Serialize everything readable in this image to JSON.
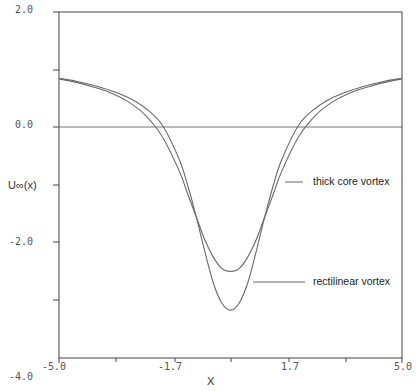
{
  "chart_data": {
    "type": "line",
    "title": "",
    "xlabel": "X",
    "ylabel": "U∞(x)",
    "xlim": [
      -5.0,
      5.0
    ],
    "ylim": [
      -4.0,
      2.0
    ],
    "x_tick_labels": [
      "-5.0",
      "-1.7",
      "1.7",
      "5.0"
    ],
    "x_ticks": [
      -5.0,
      -3.33,
      -1.67,
      0.0,
      1.67,
      3.33,
      5.0
    ],
    "y_tick_labels": [
      "2.0",
      "0.0",
      "-2.0",
      "-4.0"
    ],
    "y_ticks": [
      2.0,
      1.0,
      0.0,
      -1.0,
      -2.0,
      -3.0,
      -4.0
    ],
    "grid": false,
    "legend": "none (inline annotations)",
    "reference_line": {
      "y": 0.0
    },
    "x": [
      -5.0,
      -4.5,
      -4.0,
      -3.5,
      -3.0,
      -2.5,
      -2.0,
      -1.5,
      -1.25,
      -1.0,
      -0.75,
      -0.5,
      -0.25,
      0.0,
      0.25,
      0.5,
      0.75,
      1.0,
      1.25,
      1.5,
      2.0,
      2.5,
      3.0,
      3.5,
      4.0,
      4.5,
      5.0
    ],
    "series": [
      {
        "name": "thick core vortex",
        "values": [
          0.84,
          0.78,
          0.7,
          0.6,
          0.45,
          0.22,
          -0.15,
          -0.75,
          -1.15,
          -1.55,
          -1.95,
          -2.25,
          -2.45,
          -2.5,
          -2.45,
          -2.25,
          -1.95,
          -1.55,
          -1.15,
          -0.75,
          -0.15,
          0.22,
          0.45,
          0.6,
          0.7,
          0.78,
          0.84
        ]
      },
      {
        "name": "rectilinear vortex",
        "values": [
          0.85,
          0.8,
          0.73,
          0.64,
          0.52,
          0.34,
          0.05,
          -0.55,
          -1.0,
          -1.55,
          -2.15,
          -2.7,
          -3.05,
          -3.17,
          -3.05,
          -2.7,
          -2.15,
          -1.55,
          -1.0,
          -0.55,
          0.05,
          0.34,
          0.52,
          0.64,
          0.73,
          0.8,
          0.85
        ]
      }
    ],
    "annotations": [
      {
        "text": "thick core vortex",
        "points_to": "thick core vortex",
        "at_x": 1.1,
        "at_y": -1.45
      },
      {
        "text": "rectilinear vortex",
        "points_to": "rectilinear vortex",
        "at_x": 0.38,
        "at_y": -2.9
      }
    ]
  },
  "colors": {
    "curve": "#6a6a6a",
    "axis": "#444444",
    "text": "#333333"
  }
}
